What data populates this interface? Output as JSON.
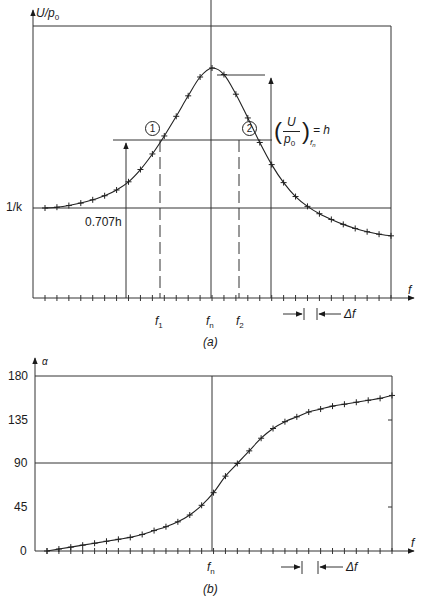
{
  "figure_a": {
    "y_axis_label": "U/p",
    "y_axis_label_sub": "0",
    "x_axis_label": "f",
    "y_ref_label": "1/k",
    "half_power_label": "0.707h",
    "peak_label_num": "U",
    "peak_label_den": "p",
    "peak_label_den_sub": "0",
    "peak_label_sub": "f",
    "peak_label_sub_sub": "n",
    "peak_label_rhs": "= h",
    "marker_1": "1",
    "marker_2": "2",
    "tick_f1": "f",
    "tick_f1_sub": "1",
    "tick_fn": "f",
    "tick_fn_sub": "n",
    "tick_f2": "f",
    "tick_f2_sub": "2",
    "delta_label": "Δf",
    "caption": "(a)"
  },
  "figure_b": {
    "y_axis_label": "α",
    "x_axis_label": "f",
    "y_ticks": [
      "180",
      "135",
      "90",
      "45",
      "0"
    ],
    "tick_fn": "f",
    "tick_fn_sub": "n",
    "delta_label": "Δf",
    "caption": "(b)"
  },
  "chart_data": [
    {
      "type": "line",
      "title": "(a) Amplitude response",
      "xlabel": "f",
      "ylabel": "U/p0",
      "annotations": [
        "1/k",
        "0.707h",
        "(U/p0)_fn = h",
        "f1",
        "fn",
        "f2",
        "Δf",
        "1",
        "2"
      ],
      "x_ticks_labeled": [
        "f1",
        "fn",
        "f2"
      ],
      "series": [
        {
          "name": "U/p0",
          "x_index": [
            0,
            1,
            2,
            3,
            4,
            5,
            6,
            7,
            8,
            9,
            10,
            11,
            12,
            13,
            14,
            15,
            16,
            17,
            18,
            19,
            20,
            21,
            22,
            23,
            24,
            25,
            26,
            27,
            28,
            29
          ],
          "values_relative": [
            1.0,
            1.01,
            1.03,
            1.06,
            1.1,
            1.15,
            1.22,
            1.32,
            1.47,
            1.66,
            1.88,
            2.12,
            2.37,
            2.6,
            2.71,
            2.63,
            2.39,
            2.1,
            1.8,
            1.53,
            1.31,
            1.14,
            1.02,
            0.93,
            0.86,
            0.8,
            0.75,
            0.71,
            0.68,
            0.66
          ]
        }
      ],
      "grid": false,
      "legend": "none"
    },
    {
      "type": "line",
      "title": "(b) Phase response",
      "xlabel": "f",
      "ylabel": "α",
      "y_ticks": [
        0,
        45,
        90,
        135,
        180
      ],
      "ylim": [
        0,
        180
      ],
      "x_ticks_labeled": [
        "fn"
      ],
      "series": [
        {
          "name": "α",
          "x_index": [
            0,
            1,
            2,
            3,
            4,
            5,
            6,
            7,
            8,
            9,
            10,
            11,
            12,
            13,
            14,
            15,
            16,
            17,
            18,
            19,
            20,
            21,
            22,
            23,
            24,
            25,
            26,
            27,
            28,
            29
          ],
          "values": [
            0,
            2,
            4,
            6,
            8,
            10,
            12,
            14,
            17,
            21,
            25,
            30,
            37,
            47,
            60,
            77,
            90,
            103,
            116,
            126,
            133,
            138,
            143,
            146,
            149,
            151,
            153,
            155,
            157,
            160
          ]
        }
      ],
      "annotations": [
        "Δf"
      ],
      "grid": false,
      "legend": "none"
    }
  ]
}
